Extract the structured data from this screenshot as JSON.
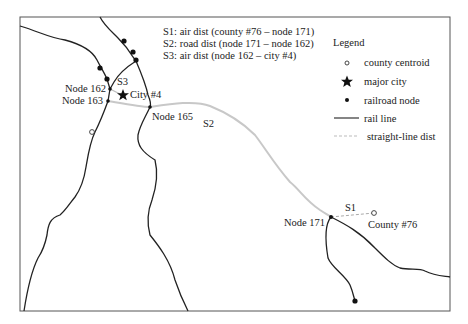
{
  "diagram": {
    "annotations": [
      "S1: air dist (county #76 – node 171)",
      "S2: road dist (node 171 – node 162)",
      "S3: air dist (node 162 – city #4)"
    ],
    "legend": {
      "title": "Legend",
      "items": [
        {
          "symbol": "open-circle",
          "label": "county centroid"
        },
        {
          "symbol": "star",
          "label": "major city"
        },
        {
          "symbol": "filled-dot",
          "label": "railroad node"
        },
        {
          "symbol": "solid-line",
          "label": "rail line"
        },
        {
          "symbol": "dashed-gray-line",
          "label": "straight-line dist"
        }
      ]
    },
    "labels": {
      "node162": "Node 162",
      "node163": "Node 163",
      "node165": "Node 165",
      "node171": "Node 171",
      "city4": "City #4",
      "county76": "County #76",
      "s1": "S1",
      "s2": "S2",
      "s3": "S3"
    },
    "colors": {
      "rail": "#222222",
      "route": "#c8c8c8",
      "frame": "#555555"
    }
  }
}
